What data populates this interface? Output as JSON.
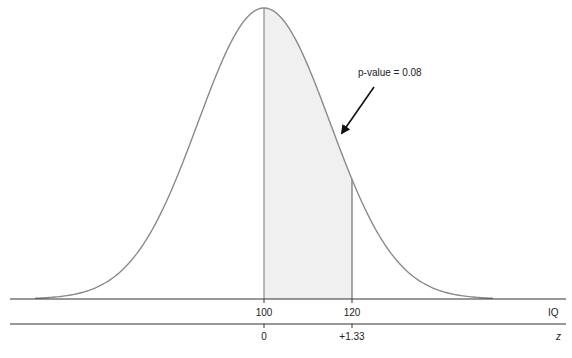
{
  "chart_data": {
    "type": "area",
    "title": "",
    "distribution": {
      "mean": 100,
      "sd": 15
    },
    "shaded_region": {
      "from": 100,
      "to": 120
    },
    "annotation": {
      "text": "p-value = 0.08",
      "arrow_to": "shaded region boundary near IQ 115"
    },
    "axes": [
      {
        "name": "IQ",
        "ticks": [
          100,
          120
        ],
        "tick_labels": [
          "100",
          "120"
        ]
      },
      {
        "name": "z",
        "ticks": [
          0,
          1.33
        ],
        "tick_labels": [
          "0",
          "+1.33"
        ]
      }
    ],
    "colors": {
      "curve": "#8a8a8a",
      "shade": "#f0f0f0",
      "axis": "#333333",
      "arrow": "#111111"
    }
  },
  "labels": {
    "annotation": "p-value = 0.08",
    "iq_axis_name": "IQ",
    "z_axis_name": "z",
    "iq_ticks": [
      "100",
      "120"
    ],
    "z_ticks": [
      "0",
      "+1.33"
    ]
  }
}
